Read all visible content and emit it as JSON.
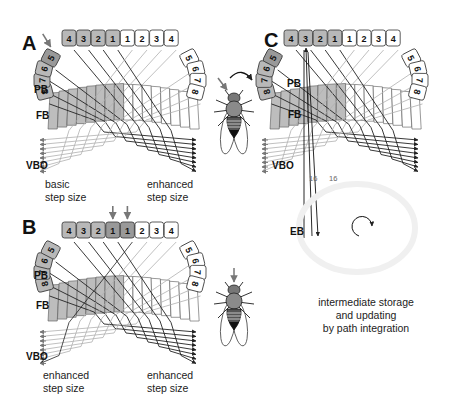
{
  "figure": {
    "panels": [
      {
        "id": "A",
        "label": "A",
        "origin": [
          0,
          0
        ],
        "pb_label": "PB",
        "fb_label": "FB",
        "vbo_label": "VBO",
        "pb_cells_left": [
          "8",
          "7",
          "6",
          "5",
          "4",
          "3",
          "2",
          "1"
        ],
        "pb_cells_right": [
          "1",
          "2",
          "3",
          "4",
          "5",
          "6",
          "7",
          "8"
        ],
        "highlighted_left": 5,
        "highlighted_right": 0,
        "stimulus_arrows_at": [
          "left-5"
        ],
        "left_caption": [
          "basic",
          "step size"
        ],
        "right_caption": [
          "enhanced",
          "step size"
        ],
        "fly": {
          "present": true,
          "arrow": "side-left",
          "rotation_arrow": true
        }
      },
      {
        "id": "B",
        "label": "B",
        "origin": [
          0,
          192
        ],
        "pb_label": "PB",
        "fb_label": "FB",
        "vbo_label": "VBO",
        "pb_cells_left": [
          "8",
          "7",
          "6",
          "5",
          "4",
          "3",
          "2",
          "1"
        ],
        "pb_cells_right": [
          "1",
          "2",
          "3",
          "4",
          "5",
          "6",
          "7",
          "8"
        ],
        "highlighted_left": 1,
        "highlighted_right": 1,
        "stimulus_arrows_at": [
          "left-1",
          "right-1"
        ],
        "left_caption": [
          "enhanced",
          "step size"
        ],
        "right_caption": [
          "enhanced",
          "step size"
        ],
        "fly": {
          "present": true,
          "arrow": "front",
          "rotation_arrow": false
        }
      },
      {
        "id": "C",
        "label": "C",
        "origin": [
          222,
          0
        ],
        "pb_label": "PB",
        "fb_label": "FB",
        "vbo_label": "VBO",
        "pb_cells_left": [
          "8",
          "7",
          "6",
          "5",
          "4",
          "3",
          "2",
          "1"
        ],
        "pb_cells_right": [
          "1",
          "2",
          "3",
          "4",
          "5",
          "6",
          "7",
          "8"
        ],
        "highlighted_left": 5,
        "highlighted_right": 0,
        "stimulus_arrows_at": [],
        "fiber_counts": [
          "16",
          "16"
        ],
        "eb_label": "EB",
        "caption": [
          "intermediate storage",
          "and updating",
          "by path integration"
        ],
        "fly": {
          "present": false
        }
      }
    ],
    "colors": {
      "pb_left_fill": "#b8b8b8",
      "pb_left_strong": "#999999",
      "pb_right_fill": "#ffffff",
      "fb_left_fill": "#bdbdbd",
      "fb_right_fill": "#ffffff",
      "line_dark": "#222222",
      "line_light": "#b0b0b0",
      "arrow_gray": "#777777"
    }
  }
}
